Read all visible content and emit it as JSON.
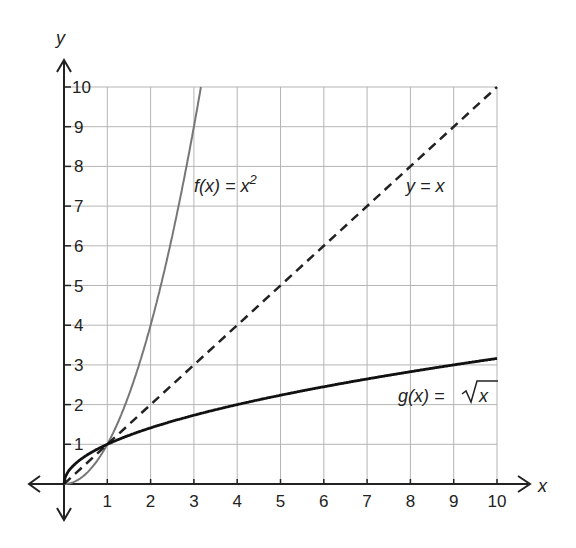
{
  "chart_data": {
    "type": "line",
    "title": "",
    "xlabel": "x",
    "ylabel": "y",
    "xlim": [
      0,
      10
    ],
    "ylim": [
      0,
      10
    ],
    "grid": true,
    "x_ticks": [
      "1",
      "2",
      "3",
      "4",
      "5",
      "6",
      "7",
      "8",
      "9",
      "10"
    ],
    "y_ticks": [
      "1",
      "2",
      "3",
      "4",
      "5",
      "6",
      "7",
      "8",
      "9",
      "10"
    ],
    "series": [
      {
        "name": "f(x) = x^2",
        "style": "solid-gray",
        "x": [
          0,
          0.5,
          1,
          1.5,
          2,
          2.5,
          3,
          3.16
        ],
        "values": [
          0,
          0.25,
          1,
          2.25,
          4,
          6.25,
          9,
          10
        ]
      },
      {
        "name": "y = x",
        "style": "dashed",
        "x": [
          0,
          10
        ],
        "values": [
          0,
          10
        ]
      },
      {
        "name": "g(x) = sqrt(x)",
        "style": "solid-black",
        "x": [
          0,
          1,
          2,
          4,
          6,
          8,
          10
        ],
        "values": [
          0,
          1,
          1.41,
          2,
          2.45,
          2.83,
          3.16
        ]
      }
    ],
    "annotations": [
      {
        "text": "f(x) = x²",
        "x": 3.2,
        "y": 7.8
      },
      {
        "text": "y = x",
        "x": 7.8,
        "y": 7.7
      },
      {
        "text": "g(x) = √x",
        "x": 7.6,
        "y": 2.0
      }
    ]
  },
  "labels": {
    "x_axis": "x",
    "y_axis": "y",
    "f": "f(x) = x",
    "f_exp": "2",
    "yx": "y = x",
    "g": "g(x) = ",
    "g_rad": "x"
  },
  "colors": {
    "f": "#777777",
    "yx": "#222222",
    "g": "#111111",
    "grid": "#b5b5b5"
  }
}
